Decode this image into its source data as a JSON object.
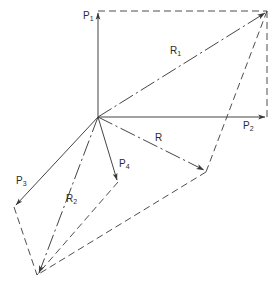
{
  "figure": {
    "name": "vector-force-resultant-diagram",
    "type": "line-diagram",
    "width": 279,
    "height": 288,
    "background": "#ffffff",
    "stroke_color": "#3a3a3a",
    "line_weight": 0.9
  },
  "geometry": {
    "origin": {
      "x": 98,
      "y": 117
    },
    "p1_tip": {
      "x": 98,
      "y": 11
    },
    "p2_tip": {
      "x": 267,
      "y": 117
    },
    "p3_tip": {
      "x": 14,
      "y": 207
    },
    "p4_tip": {
      "x": 118,
      "y": 182
    },
    "r_tip": {
      "x": 206,
      "y": 172
    },
    "r1_tip": {
      "x": 267,
      "y": 11
    },
    "r2_tip": {
      "x": 37,
      "y": 275
    },
    "upper_corner": {
      "x": 267,
      "y": 11
    },
    "lower_corner": {
      "x": 37,
      "y": 275
    }
  },
  "vectors": [
    {
      "id": "P1",
      "label": "P",
      "sub": "1",
      "style": "solid",
      "arrow": true,
      "from": "origin",
      "to": "p1_tip",
      "label_x": 83,
      "label_y": 11
    },
    {
      "id": "P2",
      "label": "P",
      "sub": "2",
      "style": "solid",
      "arrow": true,
      "from": "origin",
      "to": "p2_tip",
      "label_x": 243,
      "label_y": 121
    },
    {
      "id": "P3",
      "label": "P",
      "sub": "3",
      "style": "solid",
      "arrow": true,
      "from": "origin",
      "to": "p3_tip",
      "label_x": 16,
      "label_y": 176
    },
    {
      "id": "P4",
      "label": "P",
      "sub": "4",
      "style": "solid",
      "arrow": true,
      "from": "origin",
      "to": "p4_tip",
      "label_x": 119,
      "label_y": 159
    },
    {
      "id": "R",
      "label": "R",
      "sub": "",
      "style": "dashdot",
      "arrow": true,
      "from": "origin",
      "to": "r_tip",
      "label_x": 155,
      "label_y": 133
    },
    {
      "id": "R1",
      "label": "R",
      "sub": "1",
      "style": "dashdot",
      "arrow": true,
      "from": "origin",
      "to": "r1_tip",
      "label_x": 170,
      "label_y": 46
    },
    {
      "id": "R2",
      "label": "R",
      "sub": "2",
      "style": "dashdot",
      "arrow": true,
      "from": "origin",
      "to": "r2_tip",
      "label_x": 66,
      "label_y": 194
    }
  ],
  "construction_lines": [
    {
      "id": "p1-to-upper",
      "from": "p1_tip",
      "to": "upper_corner",
      "style": "dashed"
    },
    {
      "id": "p2-to-upper",
      "from": "p2_tip",
      "to": "upper_corner",
      "style": "dashed"
    },
    {
      "id": "p3-to-lower",
      "from": "p3_tip",
      "to": "lower_corner",
      "style": "dashed"
    },
    {
      "id": "p4-to-lower",
      "from": "p4_tip",
      "to": "lower_corner",
      "style": "dashed"
    },
    {
      "id": "rtip-to-lower",
      "from": "r_tip",
      "to": "lower_corner",
      "style": "dashed"
    },
    {
      "id": "upper-to-rtip",
      "from": "upper_corner",
      "to": "r_tip",
      "style": "dashed"
    }
  ],
  "labels": {
    "p1": "P",
    "p1_sub": "1",
    "p2": "P",
    "p2_sub": "2",
    "p3": "P",
    "p3_sub": "3",
    "p4": "P",
    "p4_sub": "4",
    "r": "R",
    "r_sub": "",
    "r1": "R",
    "r1_sub": "1",
    "r2": "R",
    "r2_sub": "2"
  }
}
